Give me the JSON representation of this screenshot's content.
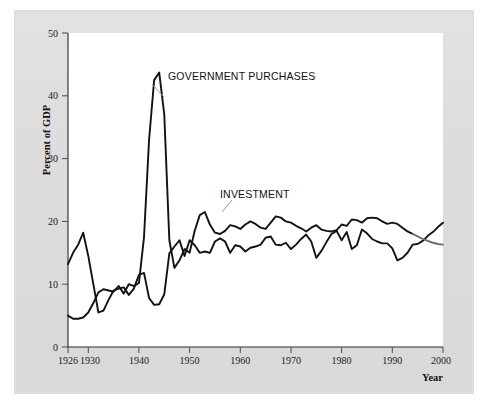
{
  "figure": {
    "background_color": "#ffffff",
    "panel_color": "#dedede",
    "plot_background_color": "#ffffff",
    "line_color": "#121212",
    "label_color": "#111111"
  },
  "axes": {
    "y_title": "Percent of GDP",
    "x_title": "Year",
    "y_ticks": [
      "0",
      "10",
      "20",
      "30",
      "40",
      "50"
    ],
    "x_ticks": [
      "1926",
      "1930",
      "1940",
      "1950",
      "1960",
      "1970",
      "1980",
      "1990",
      "2000"
    ]
  },
  "annotations": {
    "government_label": "GOVERNMENT PURCHASES",
    "investment_label": "INVESTMENT"
  },
  "chart_data": {
    "type": "line",
    "title": "",
    "xlabel": "Year",
    "ylabel": "Percent of GDP",
    "xlim": [
      1926,
      2000
    ],
    "ylim": [
      0,
      50
    ],
    "yticks": [
      0,
      10,
      20,
      30,
      40,
      50
    ],
    "xticks": [
      1926,
      1930,
      1940,
      1950,
      1960,
      1970,
      1980,
      1990,
      2000
    ],
    "grid": false,
    "legend": "inline-annotations",
    "x": [
      1926,
      1927,
      1928,
      1929,
      1930,
      1931,
      1932,
      1933,
      1934,
      1935,
      1936,
      1937,
      1938,
      1939,
      1940,
      1941,
      1942,
      1943,
      1944,
      1945,
      1946,
      1947,
      1948,
      1949,
      1950,
      1951,
      1952,
      1953,
      1954,
      1955,
      1956,
      1957,
      1958,
      1959,
      1960,
      1961,
      1962,
      1963,
      1964,
      1965,
      1966,
      1967,
      1968,
      1969,
      1970,
      1971,
      1972,
      1973,
      1974,
      1975,
      1976,
      1977,
      1978,
      1979,
      1980,
      1981,
      1982,
      1983,
      1984,
      1985,
      1986,
      1987,
      1988,
      1989,
      1990,
      1991,
      1992,
      1993,
      1994,
      1995,
      1996,
      1997,
      1998,
      1999,
      2000
    ],
    "series": [
      {
        "name": "GOVERNMENT PURCHASES",
        "values": [
          5.0,
          4.5,
          4.5,
          4.7,
          5.5,
          7.0,
          8.7,
          9.2,
          9.0,
          8.8,
          9.7,
          8.5,
          10.0,
          9.7,
          10.2,
          17.5,
          33.0,
          42.5,
          43.7,
          37.0,
          17.0,
          12.6,
          13.8,
          15.6,
          15.0,
          18.5,
          21.0,
          21.5,
          19.5,
          18.2,
          18.0,
          18.5,
          19.4,
          19.2,
          18.8,
          19.5,
          20.0,
          19.6,
          19.0,
          18.8,
          19.8,
          20.8,
          20.6,
          20.0,
          19.8,
          19.3,
          18.9,
          18.4,
          19.0,
          19.4,
          18.7,
          18.5,
          18.4,
          18.6,
          19.5,
          19.3,
          20.3,
          20.2,
          19.8,
          20.5,
          20.6,
          20.5,
          20.0,
          19.6,
          19.8,
          19.6,
          19.0,
          18.4,
          18.0,
          17.6,
          17.2,
          16.9,
          16.6,
          16.4,
          16.3
        ],
        "style": "solid-black",
        "note": "Tail from ~1994 to 2000 drawn in lighter gray in the scan"
      },
      {
        "name": "INVESTMENT",
        "values": [
          13.2,
          15.0,
          16.3,
          18.2,
          14.5,
          10.0,
          5.5,
          5.8,
          7.5,
          9.0,
          9.3,
          9.5,
          8.3,
          9.3,
          11.5,
          11.8,
          7.8,
          6.7,
          6.8,
          8.4,
          14.9,
          16.0,
          17.0,
          14.5,
          17.0,
          16.2,
          15.0,
          15.2,
          15.0,
          16.8,
          17.3,
          16.8,
          15.0,
          16.2,
          16.0,
          15.2,
          15.8,
          16.0,
          16.3,
          17.4,
          17.6,
          16.3,
          16.2,
          16.6,
          15.6,
          16.3,
          17.2,
          17.9,
          16.8,
          14.2,
          15.3,
          16.7,
          18.0,
          18.5,
          17.0,
          18.3,
          15.6,
          16.2,
          18.7,
          18.1,
          17.2,
          16.8,
          16.5,
          16.5,
          15.7,
          13.8,
          14.2,
          15.0,
          16.3,
          16.4,
          16.9,
          17.7,
          18.3,
          19.1,
          19.8
        ],
        "style": "solid-black"
      }
    ]
  }
}
